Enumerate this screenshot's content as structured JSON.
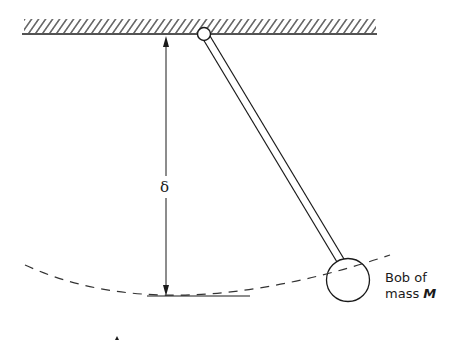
{
  "diagram": {
    "labels": {
      "delta": "δ",
      "bob_line1": "Bob of",
      "bob_line2_prefix": "mass ",
      "bob_mass_symbol": "M"
    },
    "colors": {
      "stroke": "#1a1a1a",
      "background": "#ffffff"
    }
  }
}
